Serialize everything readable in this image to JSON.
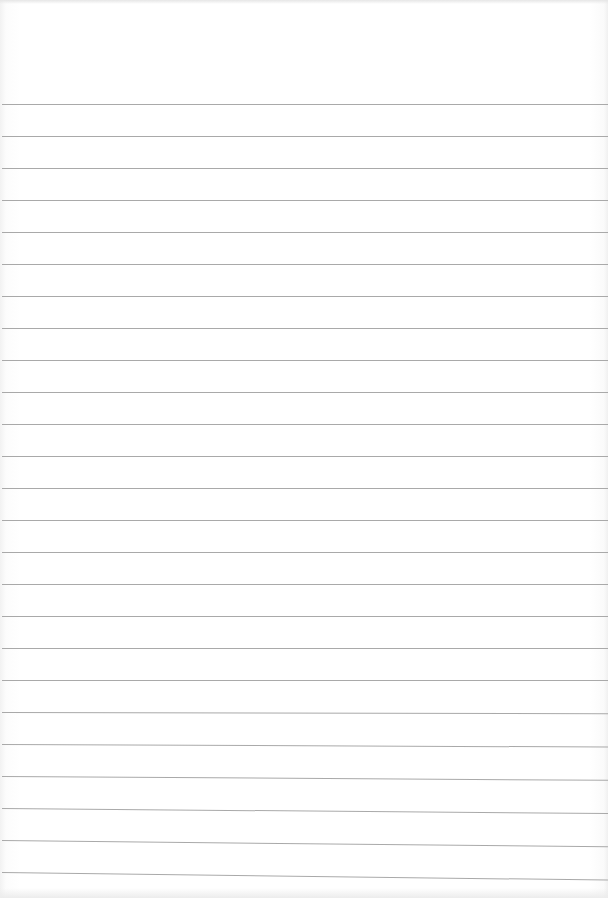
{
  "sheet": {
    "description": "blank ruled notebook paper",
    "background_color": "#ffffff",
    "line_color": "#a9a9a9",
    "line_spacing_px": 32,
    "first_line_y": 104,
    "line_count": 25,
    "text": ""
  }
}
